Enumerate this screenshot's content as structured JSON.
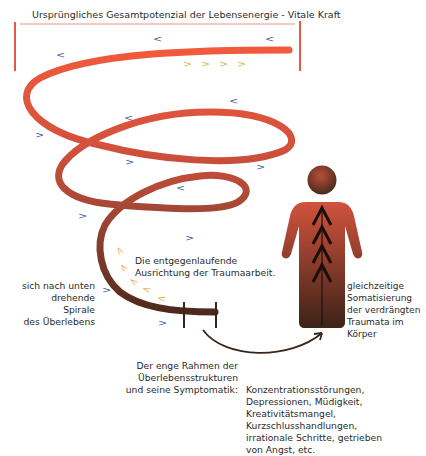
{
  "title": "Ursprüngliches Gesamtpotenzial der Lebensenergie - Vitale Kraft",
  "colors": {
    "frame_red": "#e8584a",
    "spiral_top": "#ee5a40",
    "spiral_mid": "#b5503a",
    "spiral_bottom": "#4a2a1e",
    "arrow_blue": "#3b5a9a",
    "arrow_orange": "#f0a845",
    "figure_top": "#d4533e",
    "figure_bottom": "#4a2a1e"
  },
  "labels": {
    "counter_direction": "Die entgegenlaufende\nAusrichtung der Traumaarbeit.",
    "spiral_down": "sich nach unten\ndrehende Spirale\ndes Überlebens",
    "somatization": "gleichzeitige\nSomatisierung\nder verdrängten\nTraumata im\nKörper",
    "narrow_frame": "Der enge Rahmen der\nÜberlebensstrukturen\nund seine Symptomatik:",
    "symptoms": "Konzentrationsstörungen,\nDepressionen, Müdigkeit,\nKreativitätsmangel,\nKurzschlusshandlungen,\nirrationale Schritte, getrieben\nvon Angst, etc."
  },
  "arrows": {
    "blue_left": "<",
    "blue_right": ">",
    "orange_right": ">",
    "orange_up": "<"
  },
  "icons": {
    "figure": "person-silhouette-icon",
    "up_chevrons": "up-arrow-chevrons-icon",
    "curved_arrow": "curved-arrow-icon"
  }
}
